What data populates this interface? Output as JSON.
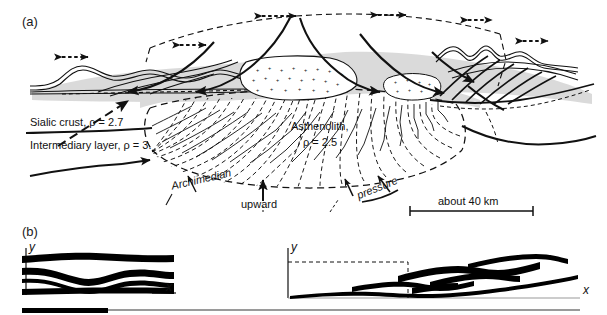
{
  "figure": {
    "type": "geological-cross-section-diagram",
    "background_color": "#ffffff",
    "ink_color": "#111111",
    "crust_fill_color": "#d8d8d8"
  },
  "panels": [
    {
      "id": "a",
      "label": "(a)",
      "description": "Crustal cross-section with asthenolith dome, thrust sheets and extension arrows"
    },
    {
      "id": "b",
      "label": "(b)",
      "description": "Two deformation sketches: initial folded layers and sheared nappe stack"
    }
  ],
  "panel_a": {
    "labels": {
      "sialic_crust": "Sialic crust, ρ = 2.7",
      "intermediary_layer": "Intermediary layer, ρ = 3.",
      "asthenolith_name": "Asthenolith,",
      "asthenolith_density": "ρ = 2.5",
      "archimedian": "Archimedian",
      "upward": "upward",
      "pressure": "pressure"
    },
    "scale_bar": {
      "text": "about 40 km"
    },
    "densities": [
      {
        "unit": "Sialic crust",
        "rho": 2.7
      },
      {
        "unit": "Intermediary layer",
        "rho": 3.0
      },
      {
        "unit": "Asthenolith",
        "rho": 2.5
      }
    ],
    "forces": [
      "Archimedian",
      "upward",
      "pressure"
    ]
  },
  "panel_b": {
    "left_plot": {
      "y_axis_label": "y",
      "x_axis_label": "x",
      "content": "four wavy folded dark layers"
    },
    "right_plot": {
      "y_axis_label": "y",
      "x_axis_label": "x",
      "content": "sheared and thinned layers forming imbricate nappes, dashed box shows original extent"
    }
  }
}
